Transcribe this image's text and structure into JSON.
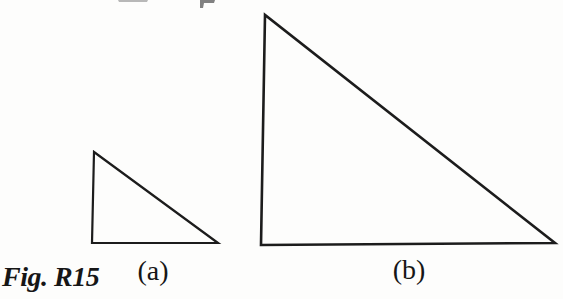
{
  "colors": {
    "background": "#fdfdfc",
    "line": "#1c1c1c",
    "text": "#161616"
  },
  "figure": {
    "caption": "Fig. R15",
    "triangle_a": {
      "label": "(a)",
      "points": "94,152 92,243 218,243"
    },
    "triangle_b": {
      "label": "(b)",
      "points": "265,15 261,245 555,243"
    },
    "artifacts": [
      {
        "d": "M118,0 L148,0 L147,2 L119,2 Z"
      },
      {
        "d": "M200,0 L215,0 L214,3 L204,3 L203,8 L200,8 Z"
      }
    ]
  }
}
